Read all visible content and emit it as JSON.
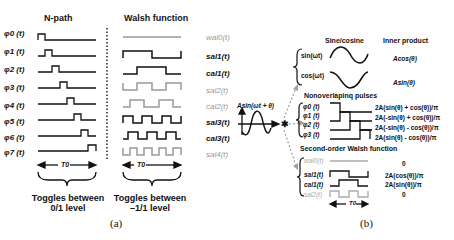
{
  "panel_a": {
    "npath": {
      "title": "N-path",
      "signals": [
        "φ0 (t)",
        "φ1 (t)",
        "φ2 (t)",
        "φ3 (t)",
        "φ4 (t)",
        "φ5 (t)",
        "φ6 (t)",
        "φ7 (t)"
      ],
      "period_label": "T0",
      "note_line1": "Toggles between",
      "note_line2": "0/1 level"
    },
    "walsh": {
      "title": "Walsh function",
      "signals": [
        {
          "label": "wal0(t)",
          "color": "gray"
        },
        {
          "label": "sal1(t)",
          "color": "black"
        },
        {
          "label": "cal1(t)",
          "color": "black"
        },
        {
          "label": "sal2(t)",
          "color": "gray"
        },
        {
          "label": "cal2(t)",
          "color": "gray"
        },
        {
          "label": "sal3(t)",
          "color": "black"
        },
        {
          "label": "cal3(t)",
          "color": "black"
        },
        {
          "label": "sal4(t)",
          "color": "gray"
        }
      ],
      "period_label": "T0",
      "note_line1": "Toggles between",
      "note_line2": "–1/1 level"
    },
    "caption": "(a)"
  },
  "panel_b": {
    "input_label": "Asin(ωt + θ)",
    "sinecos": {
      "col1_header": "Sine/cosine",
      "col2_header": "Inner product",
      "rows": [
        {
          "label": "sin(ωt)",
          "result": "Acos(θ)"
        },
        {
          "label": "cos(ωt)",
          "result": "Asin(θ)"
        }
      ]
    },
    "pulses": {
      "header": "Nonoverlapinq pulses",
      "rows": [
        {
          "label": "φ0 (t)",
          "result": "2A(sin(θ) + cos(θ))/π"
        },
        {
          "label": "φ1 (t)",
          "result": "2A(-sin(θ) + cos(θ))/π"
        },
        {
          "label": "φ2 (t)",
          "result": "2A(-sin(θ) - cos(θ))/π"
        },
        {
          "label": "φ3 (t)",
          "result": "2A(sin(θ) - cos(θ))/π"
        }
      ]
    },
    "walsh2": {
      "header": "Second-order Walsh function",
      "rows": [
        {
          "label": "wal0(t)",
          "result": "0",
          "color": "gray"
        },
        {
          "label": "sal1(t)",
          "result": "2A(cos(θ))/π",
          "color": "black"
        },
        {
          "label": "cal1(t)",
          "result": "2A(sin(θ))/π",
          "color": "black"
        },
        {
          "label": "sal2(t)",
          "result": "0",
          "color": "gray"
        }
      ],
      "period_label": "T0"
    },
    "caption": "(b)"
  },
  "colors": {
    "black": "#111111",
    "gray": "#9a9a9a",
    "arrow": "#a0a0a0"
  }
}
